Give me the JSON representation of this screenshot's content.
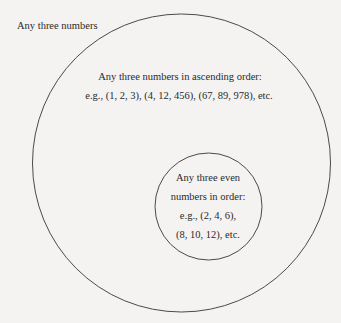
{
  "diagram": {
    "type": "venn-nested",
    "outer_region": {
      "label": "Any three numbers"
    },
    "middle_set": {
      "title": "Any three numbers in ascending order:",
      "examples": "e.g., (1, 2, 3), (4, 12, 456), (67, 89, 978), etc."
    },
    "inner_set": {
      "lines": [
        "Any three even",
        "numbers in order:",
        "e.g., (2, 4, 6),",
        "(8, 10, 12), etc."
      ]
    },
    "colors": {
      "background": "#f4f3f1",
      "stroke": "#4a4a4a",
      "text": "#2a2a2a"
    }
  }
}
